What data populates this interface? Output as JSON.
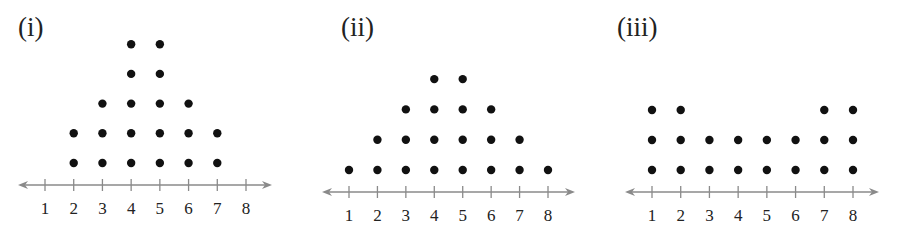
{
  "chart_data": [
    {
      "type": "scatter",
      "subtype": "dot_plot",
      "title": "(i)",
      "x": [
        1,
        2,
        3,
        4,
        5,
        6,
        7,
        8
      ],
      "counts": [
        0,
        2,
        3,
        5,
        5,
        3,
        2,
        0
      ],
      "tick_labels": [
        "1",
        "2",
        "3",
        "4",
        "5",
        "6",
        "7",
        "8"
      ],
      "xlabel": "",
      "ylabel": "",
      "xlim": [
        1,
        8
      ],
      "grid": false
    },
    {
      "type": "scatter",
      "subtype": "dot_plot",
      "title": "(ii)",
      "x": [
        1,
        2,
        3,
        4,
        5,
        6,
        7,
        8
      ],
      "counts": [
        1,
        2,
        3,
        4,
        4,
        3,
        2,
        1
      ],
      "tick_labels": [
        "1",
        "2",
        "3",
        "4",
        "5",
        "6",
        "7",
        "8"
      ],
      "xlabel": "",
      "ylabel": "",
      "xlim": [
        1,
        8
      ],
      "grid": false
    },
    {
      "type": "scatter",
      "subtype": "dot_plot",
      "title": "(iii)",
      "x": [
        1,
        2,
        3,
        4,
        5,
        6,
        7,
        8
      ],
      "counts": [
        3,
        3,
        2,
        2,
        2,
        2,
        3,
        3
      ],
      "tick_labels": [
        "1",
        "2",
        "3",
        "4",
        "5",
        "6",
        "7",
        "8"
      ],
      "xlabel": "",
      "ylabel": "",
      "xlim": [
        1,
        8
      ],
      "grid": false
    }
  ],
  "colors": {
    "dot": "#111111",
    "axis": "#8a8a8a",
    "label": "#222222"
  },
  "layout": [
    {
      "panel_x": 0,
      "title_x": 18,
      "title_y": 14,
      "x1": 45,
      "x8": 246,
      "axis_y": 185,
      "arrow_left": 18,
      "arrow_right": 272,
      "row0_y": 163,
      "row_gap": 29.7
    },
    {
      "panel_x": 0,
      "title_x": 341,
      "title_y": 14,
      "x1": 349,
      "x8": 548,
      "axis_y": 192,
      "arrow_left": 322,
      "arrow_right": 575,
      "row0_y": 170,
      "row_gap": 30.3
    },
    {
      "panel_x": 0,
      "title_x": 617,
      "title_y": 14,
      "x1": 652,
      "x8": 853,
      "axis_y": 192,
      "arrow_left": 625,
      "arrow_right": 879,
      "row0_y": 170,
      "row_gap": 30
    }
  ]
}
